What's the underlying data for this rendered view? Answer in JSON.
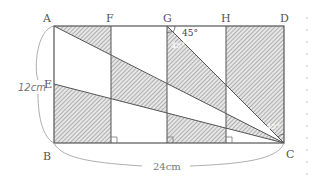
{
  "diagram": {
    "type": "geometry-figure",
    "points": {
      "A": "A",
      "F": "F",
      "G": "G",
      "H": "H",
      "D": "D",
      "E": "E",
      "B": "B",
      "C": "C"
    },
    "dimensions": {
      "height": "12cm",
      "width": "24cm"
    },
    "angles": {
      "at_g_outer": "45°",
      "at_g_inner": "45°",
      "at_c": "45°"
    },
    "colors": {
      "line": "#555555",
      "hatch": "#888888",
      "label": "#555555"
    }
  }
}
